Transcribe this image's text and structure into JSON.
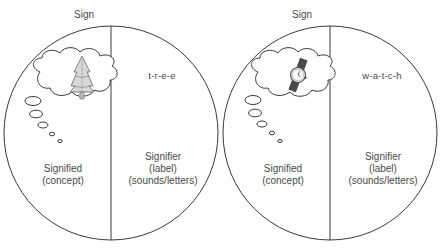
{
  "diagrams": [
    {
      "title": "Sign",
      "concept_icon": "tree-icon",
      "signifier_word": "t-r-e-e",
      "signified": {
        "line1": "Signified",
        "line2": "(concept)"
      },
      "signifier": {
        "line1": "Signifier",
        "line2": "(label)",
        "line3": "(sounds/letters)"
      }
    },
    {
      "title": "Sign",
      "concept_icon": "wristwatch-icon",
      "signifier_word": "w-a-t-c-h",
      "signified": {
        "line1": "Signified",
        "line2": "(concept)"
      },
      "signifier": {
        "line1": "Signifier",
        "line2": "(label)",
        "line3": "(sounds/letters)"
      }
    }
  ],
  "colors": {
    "stroke": "#3a3a3a",
    "text": "#4a4a4a",
    "background": "#ffffff"
  }
}
